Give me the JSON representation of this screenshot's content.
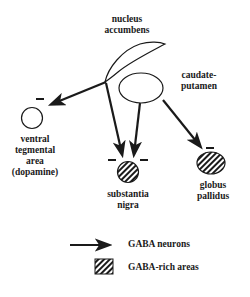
{
  "labels": {
    "nucleus_accumbens": [
      "nucleus",
      "accumbens"
    ],
    "caudate_putamen": [
      "caudate-",
      "putamen"
    ],
    "ventral_tegmental_area": [
      "ventral",
      "tegmental",
      "area",
      "(dopamine)"
    ],
    "substantia_nigra": [
      "substantia",
      "nigra"
    ],
    "globus_pallidus": [
      "globus",
      "pallidus"
    ]
  },
  "inhibition_marker": "−",
  "legend": {
    "arrow_label": "GABA neurons",
    "hatch_label": "GABA-rich areas"
  },
  "colors": {
    "ink": "#1a1a1a",
    "background": "#ffffff"
  }
}
